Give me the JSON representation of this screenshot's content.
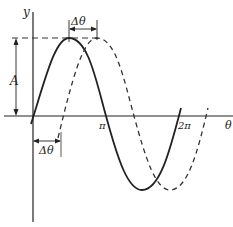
{
  "diagram": {
    "title": "",
    "axes": {
      "x_label": "θ",
      "y_label": "y"
    },
    "ticks": {
      "pi": "π",
      "two_pi": "2π"
    },
    "annotations": {
      "amplitude": "A",
      "phase_shift_top": "Δθ",
      "phase_shift_bottom": "Δθ"
    },
    "curves": [
      {
        "name": "reference sine",
        "style": "solid"
      },
      {
        "name": "phase-shifted sine",
        "style": "dashed"
      }
    ],
    "colors": {
      "ink": "#222222",
      "background": "#ffffff"
    }
  }
}
